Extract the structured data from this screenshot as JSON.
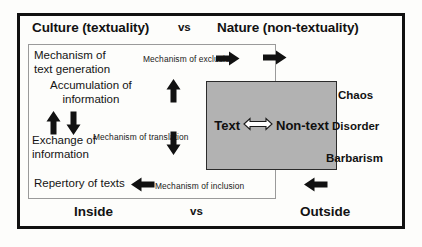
{
  "diagram": {
    "title_row": {
      "left": "Culture (textuality)",
      "middle": "vs",
      "right": "Nature (non-textuality)"
    },
    "bottom_row": {
      "left": "Inside",
      "middle": "vs",
      "right": "Outside"
    },
    "inside_box": {
      "items": [
        "Mechanism of\ntext generation",
        "Accumulation of\ninformation",
        "Exchange of\ninformation",
        "Repertory of texts"
      ],
      "item_text_generation": "Mechanism of\ntext generation",
      "item_accumulation": "Accumulation of\ninformation",
      "item_exchange": "Exchange of\ninformation",
      "item_repertory": "Repertory of texts"
    },
    "mechanisms": {
      "exclusion": "Mechanism of exclusion",
      "translation": "Mechanism of translation",
      "inclusion": "Mechanism of inclusion"
    },
    "center_box": {
      "left_label": "Text",
      "right_label": "Non-text",
      "relation_icon": "double-headed-arrow",
      "fill_color": "#b2b2b2"
    },
    "outside_terms": [
      "Chaos",
      "Disorder",
      "Barbarism"
    ],
    "outside_term_1": "Chaos",
    "outside_term_2": "Disorder",
    "outside_term_3": "Barbarism",
    "colors": {
      "frame": "#111111",
      "inner_frame": "#9a9a9a",
      "center_fill": "#b2b2b2",
      "text": "#121212"
    }
  }
}
